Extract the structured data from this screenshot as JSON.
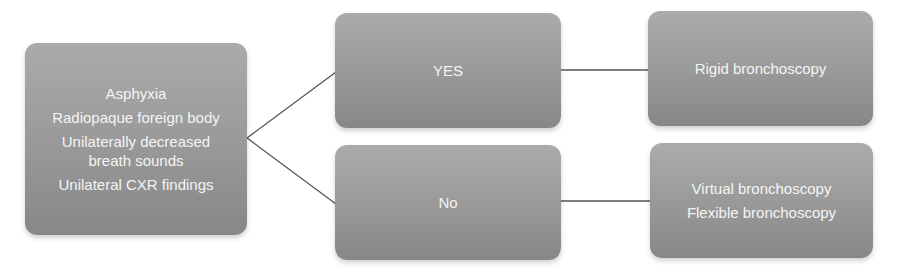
{
  "diagram": {
    "type": "decision-flowchart",
    "colors": {
      "node_fill_top": "#ababab",
      "node_fill_bottom": "#878787",
      "node_text": "#f4f4f4",
      "connector": "#555555",
      "background": "#ffffff"
    },
    "criteria_node": {
      "lines": [
        "Asphyxia",
        "Radiopaque foreign body",
        "Unilaterally decreased",
        "breath sounds",
        "Unilateral CXR findings"
      ]
    },
    "decision_nodes": {
      "yes": {
        "label": "YES"
      },
      "no": {
        "label": "No"
      }
    },
    "outcome_nodes": {
      "yes_outcome": {
        "lines": [
          "Rigid bronchoscopy"
        ]
      },
      "no_outcome": {
        "lines": [
          "Virtual bronchoscopy",
          "Flexible bronchoscopy"
        ]
      }
    },
    "edges": [
      {
        "from": "criteria",
        "to": "yes"
      },
      {
        "from": "criteria",
        "to": "no"
      },
      {
        "from": "yes",
        "to": "yes_outcome"
      },
      {
        "from": "no",
        "to": "no_outcome"
      }
    ]
  }
}
